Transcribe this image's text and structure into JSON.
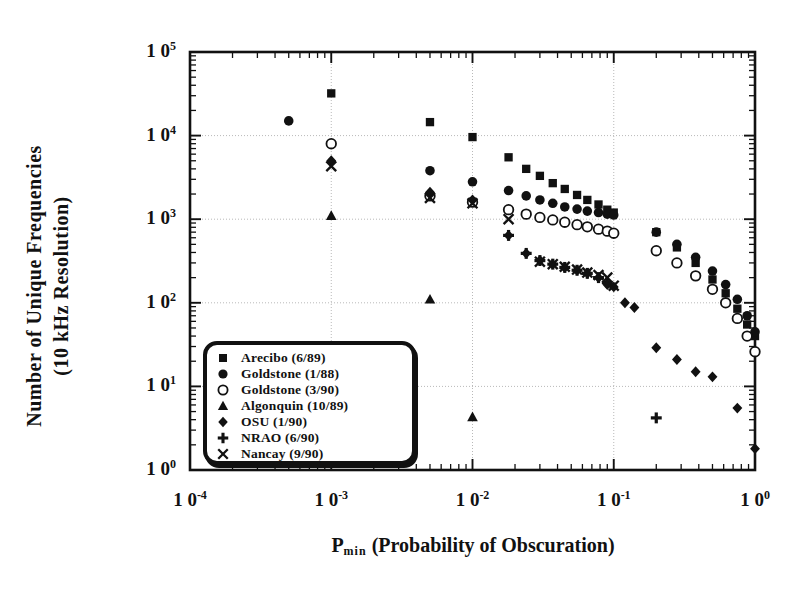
{
  "figure": {
    "ylabel_line1": "Number of Unique Frequencies",
    "ylabel_line2": "(10 kHz Resolution)",
    "xlabel_prefix": "P",
    "xlabel_sub": "min",
    "xlabel_rest": "(Probability of Obscuration)",
    "ink": "#111111",
    "grid_color": "#b9b9b9",
    "background": "#ffffff"
  },
  "chart_data": {
    "type": "scatter",
    "title": "",
    "xlabel": "P_min (Probability of Obscuration)",
    "ylabel": "Number of Unique Frequencies (10 kHz Resolution)",
    "xscale": "log",
    "yscale": "log",
    "xlim": [
      0.0001,
      1.0
    ],
    "ylim": [
      1,
      100000
    ],
    "xticks": [
      0.0001,
      0.001,
      0.01,
      0.1,
      1
    ],
    "xticklabels": [
      "10 -4",
      "10 -3",
      "10 -2",
      "10 -1",
      "10 0"
    ],
    "yticks": [
      1,
      10,
      100,
      1000,
      10000,
      100000
    ],
    "yticklabels": [
      "10 0",
      "10 1",
      "10 2",
      "10 3",
      "10 4",
      "10 5"
    ],
    "grid": true,
    "legend_position": "lower left",
    "series": [
      {
        "name": "Arecibo  (6/89)",
        "marker": "filled-square",
        "points": [
          [
            0.001,
            32000
          ],
          [
            0.005,
            14500
          ],
          [
            0.01,
            9600
          ],
          [
            0.018,
            5500
          ],
          [
            0.024,
            4000
          ],
          [
            0.03,
            3300
          ],
          [
            0.037,
            2700
          ],
          [
            0.045,
            2300
          ],
          [
            0.055,
            1950
          ],
          [
            0.065,
            1700
          ],
          [
            0.078,
            1500
          ],
          [
            0.09,
            1300
          ],
          [
            0.1,
            1200
          ],
          [
            0.2,
            700
          ],
          [
            0.28,
            460
          ],
          [
            0.38,
            300
          ],
          [
            0.5,
            190
          ],
          [
            0.62,
            130
          ],
          [
            0.75,
            85
          ],
          [
            0.88,
            55
          ],
          [
            1.0,
            40
          ]
        ]
      },
      {
        "name": "Goldstone  (1/88)",
        "marker": "filled-circle",
        "points": [
          [
            0.0005,
            15000
          ],
          [
            0.001,
            8000
          ],
          [
            0.005,
            3800
          ],
          [
            0.01,
            2800
          ],
          [
            0.018,
            2200
          ],
          [
            0.024,
            1900
          ],
          [
            0.03,
            1700
          ],
          [
            0.037,
            1550
          ],
          [
            0.045,
            1400
          ],
          [
            0.055,
            1320
          ],
          [
            0.065,
            1250
          ],
          [
            0.078,
            1200
          ],
          [
            0.09,
            1150
          ],
          [
            0.1,
            1120
          ],
          [
            0.2,
            700
          ],
          [
            0.28,
            500
          ],
          [
            0.38,
            350
          ],
          [
            0.5,
            240
          ],
          [
            0.62,
            165
          ],
          [
            0.75,
            110
          ],
          [
            0.88,
            70
          ],
          [
            1.0,
            45
          ]
        ]
      },
      {
        "name": "Goldstone  (3/90)",
        "marker": "open-circle",
        "points": [
          [
            0.001,
            8000
          ],
          [
            0.005,
            1900
          ],
          [
            0.01,
            1600
          ],
          [
            0.018,
            1300
          ],
          [
            0.024,
            1150
          ],
          [
            0.03,
            1050
          ],
          [
            0.037,
            980
          ],
          [
            0.045,
            920
          ],
          [
            0.055,
            860
          ],
          [
            0.065,
            810
          ],
          [
            0.078,
            760
          ],
          [
            0.09,
            720
          ],
          [
            0.1,
            680
          ],
          [
            0.2,
            420
          ],
          [
            0.28,
            300
          ],
          [
            0.38,
            210
          ],
          [
            0.5,
            145
          ],
          [
            0.62,
            100
          ],
          [
            0.75,
            65
          ],
          [
            0.88,
            40
          ],
          [
            1.0,
            26
          ]
        ]
      },
      {
        "name": "Algonquin  (10/89)",
        "marker": "filled-triangle",
        "points": [
          [
            0.001,
            1100
          ],
          [
            0.005,
            110
          ],
          [
            0.01,
            4.3
          ]
        ]
      },
      {
        "name": "OSU  (1/90)",
        "marker": "filled-diamond",
        "points": [
          [
            0.001,
            5000
          ],
          [
            0.005,
            2100
          ],
          [
            0.01,
            1700
          ],
          [
            0.018,
            640
          ],
          [
            0.024,
            390
          ],
          [
            0.03,
            320
          ],
          [
            0.037,
            290
          ],
          [
            0.045,
            265
          ],
          [
            0.055,
            245
          ],
          [
            0.065,
            225
          ],
          [
            0.078,
            200
          ],
          [
            0.09,
            165
          ],
          [
            0.1,
            155
          ],
          [
            0.12,
            100
          ],
          [
            0.14,
            88
          ],
          [
            0.2,
            29
          ],
          [
            0.28,
            21
          ],
          [
            0.38,
            15
          ],
          [
            0.5,
            13
          ],
          [
            0.75,
            5.5
          ],
          [
            1.0,
            1.8
          ]
        ]
      },
      {
        "name": "NRAO  (6/90)",
        "marker": "plus",
        "points": [
          [
            0.018,
            640
          ],
          [
            0.024,
            390
          ],
          [
            0.03,
            320
          ],
          [
            0.037,
            290
          ],
          [
            0.045,
            265
          ],
          [
            0.055,
            245
          ],
          [
            0.065,
            225
          ],
          [
            0.078,
            200
          ],
          [
            0.09,
            175
          ],
          [
            0.2,
            4.2
          ]
        ]
      },
      {
        "name": "Nancay  (9/90)",
        "marker": "cross",
        "points": [
          [
            0.001,
            4300
          ],
          [
            0.005,
            1800
          ],
          [
            0.01,
            1550
          ],
          [
            0.018,
            1000
          ],
          [
            0.03,
            310
          ],
          [
            0.037,
            290
          ],
          [
            0.045,
            270
          ],
          [
            0.055,
            250
          ],
          [
            0.065,
            230
          ],
          [
            0.078,
            215
          ],
          [
            0.09,
            200
          ],
          [
            0.1,
            160
          ]
        ]
      }
    ]
  },
  "legend": {
    "items": [
      {
        "label": "Arecibo  (6/89)",
        "marker": "filled-square"
      },
      {
        "label": "Goldstone  (1/88)",
        "marker": "filled-circle"
      },
      {
        "label": "Goldstone  (3/90)",
        "marker": "open-circle"
      },
      {
        "label": "Algonquin  (10/89)",
        "marker": "filled-triangle"
      },
      {
        "label": "OSU  (1/90)",
        "marker": "filled-diamond"
      },
      {
        "label": "NRAO  (6/90)",
        "marker": "plus"
      },
      {
        "label": "Nancay  (9/90)",
        "marker": "cross"
      }
    ]
  }
}
